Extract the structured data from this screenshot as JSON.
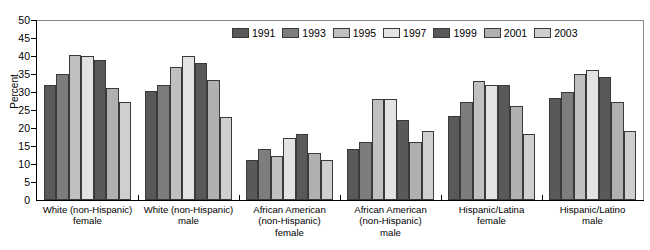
{
  "chart_data": {
    "type": "bar",
    "title": "",
    "xlabel": "",
    "ylabel": "Percent",
    "ylim": [
      0,
      50
    ],
    "yticks": [
      0,
      5,
      10,
      15,
      20,
      25,
      30,
      35,
      40,
      45,
      50
    ],
    "grid": false,
    "legend_position": "top-right",
    "categories": [
      "White (non-Hispanic) female",
      "White (non-Hispanic) male",
      "African American (non-Hispanic) female",
      "African American (non-Hispanic) male",
      "Hispanic/Latina female",
      "Hispanic/Latino male"
    ],
    "category_lines": [
      [
        "White (non-Hispanic)",
        "female"
      ],
      [
        "White (non-Hispanic)",
        "male"
      ],
      [
        "African American",
        "(non-Hispanic)",
        "female"
      ],
      [
        "African American",
        "(non-Hispanic)",
        "male"
      ],
      [
        "Hispanic/Latina",
        "female"
      ],
      [
        "Hispanic/Latino",
        "male"
      ]
    ],
    "series": [
      {
        "name": "1991",
        "color": "#595959",
        "values": [
          32,
          30.2,
          11.2,
          14.2,
          23.3,
          28.2
        ]
      },
      {
        "name": "1993",
        "color": "#7d7d7d",
        "values": [
          35,
          32,
          14.1,
          16.2,
          27.1,
          30.1
        ]
      },
      {
        "name": "1995",
        "color": "#c0c0c0",
        "values": [
          40.2,
          37,
          12.2,
          28,
          33.1,
          35.1
        ]
      },
      {
        "name": "1997",
        "color": "#e3e3e3",
        "values": [
          40,
          40,
          17.1,
          28,
          32,
          36
        ]
      },
      {
        "name": "1999",
        "color": "#595959",
        "values": [
          39,
          38,
          18.2,
          22.1,
          32,
          34.1
        ]
      },
      {
        "name": "2001",
        "color": "#b0b0b0",
        "values": [
          31,
          33.3,
          13.1,
          16.1,
          26,
          27.1
        ]
      },
      {
        "name": "2003",
        "color": "#cfcfcf",
        "values": [
          27.1,
          23.1,
          11.1,
          19.1,
          18.4,
          19.2
        ]
      }
    ]
  }
}
